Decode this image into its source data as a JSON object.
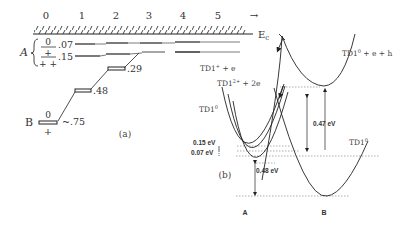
{
  "panel_a": {
    "caption": "(a)",
    "axis_ticks": [
      "0",
      "1",
      "2",
      "3",
      "4",
      "5"
    ],
    "axis_arrow": "→",
    "conduction_band_label": "E",
    "conduction_band_sub": "c",
    "group_a_label": "A",
    "group_b_label": "B",
    "levels": [
      {
        "charge_above": "0",
        "value": ".07"
      },
      {
        "charge_above": "+",
        "value": ".15"
      },
      {
        "charge_above": "",
        "value": ".29"
      },
      {
        "charge_above": "",
        "value": ".48"
      },
      {
        "charge_above": "0",
        "value": "~.75"
      }
    ],
    "charge_a_bottom": "+ +",
    "charge_b_bottom": "+"
  },
  "panel_b": {
    "caption": "(b)",
    "curve_labels": {
      "td1_plus_e": "TD1",
      "td1_plus_e_sup": "+",
      "td1_plus_e_suffix": " + e",
      "td1_2plus_2e": "TD1",
      "td1_2plus_2e_sup": "2+",
      "td1_2plus_2e_suffix": " + 2e",
      "td1_0_left": "TD1",
      "td1_0_left_sup": "0",
      "td1_0_eh": "TD1",
      "td1_0_eh_sup": "0",
      "td1_0_eh_suffix": " + e + h",
      "td1_0_right": "TD1",
      "td1_0_right_sup": "0"
    },
    "energies": {
      "e1": "0.15 eV",
      "e2": "0.07 eV",
      "e3": "0.47 eV",
      "e4": "0.48 eV"
    },
    "config_labels": {
      "left": "A",
      "right": "B"
    }
  }
}
